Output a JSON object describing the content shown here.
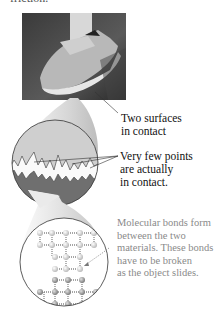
{
  "figure": {
    "top_partial_text": "friction.",
    "photo_alt": "running-shoe-on-floor",
    "labels": {
      "two_surfaces": [
        "Two surfaces",
        "in contact"
      ],
      "few_points": [
        "Very few points",
        "are actually",
        "in contact."
      ],
      "molecular": [
        "Molecular bonds form",
        "between the two",
        "materials. These bonds",
        "have to be broken",
        "as the object slides."
      ]
    },
    "colors": {
      "text": "#111111",
      "gray_text": "#8a8a8a",
      "upper_surface": "#cfcfcf",
      "lower_surface": "#6f6f6f",
      "atom_light": "#d8d8d8",
      "atom_dark": "#9a9a9a"
    }
  }
}
